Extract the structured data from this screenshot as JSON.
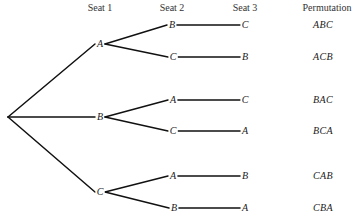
{
  "headers": {
    "seat1": "Seat 1",
    "seat2": "Seat 2",
    "seat3": "Seat 3",
    "permutation": "Permutation"
  },
  "tree": {
    "root": {
      "x": 8,
      "y": 117
    },
    "seat1_nodes": [
      {
        "label": "A",
        "x": 100,
        "y": 44
      },
      {
        "label": "B",
        "x": 100,
        "y": 117
      },
      {
        "label": "C",
        "x": 100,
        "y": 192
      }
    ],
    "seat2_nodes": [
      {
        "label": "B",
        "x": 172,
        "y": 25,
        "parent": 0
      },
      {
        "label": "C",
        "x": 173,
        "y": 57,
        "parent": 0
      },
      {
        "label": "A",
        "x": 173,
        "y": 100,
        "parent": 1
      },
      {
        "label": "C",
        "x": 173,
        "y": 131,
        "parent": 1
      },
      {
        "label": "A",
        "x": 173,
        "y": 176,
        "parent": 2
      },
      {
        "label": "B",
        "x": 174,
        "y": 208,
        "parent": 2
      }
    ],
    "seat3_nodes": [
      {
        "label": "C",
        "x": 245,
        "y": 25
      },
      {
        "label": "B",
        "x": 245,
        "y": 57
      },
      {
        "label": "C",
        "x": 245,
        "y": 100
      },
      {
        "label": "A",
        "x": 245,
        "y": 131
      },
      {
        "label": "B",
        "x": 245,
        "y": 176
      },
      {
        "label": "A",
        "x": 245,
        "y": 208
      }
    ]
  },
  "permutations": [
    "ABC",
    "ACB",
    "BAC",
    "BCA",
    "CAB",
    "CBA"
  ],
  "colors": {
    "line": "#111111",
    "text": "#1a1a1a",
    "background": "#ffffff"
  }
}
